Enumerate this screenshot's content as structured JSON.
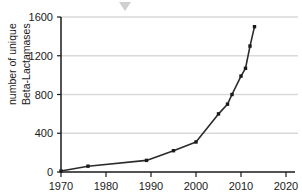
{
  "chart_data": {
    "type": "line",
    "title": "",
    "xlabel": "",
    "ylabel": "number of unique Beta-Lactamases",
    "ylabel_line1": "number of unique",
    "ylabel_line2": "Beta-Lactamases",
    "xlim": [
      1970,
      2020
    ],
    "ylim": [
      0,
      1600
    ],
    "xticks": [
      1970,
      1980,
      1990,
      2000,
      2010,
      2020
    ],
    "yticks": [
      0,
      400,
      800,
      1200,
      1600
    ],
    "xtick_labels": [
      "1970",
      "1980",
      "1990",
      "2000",
      "2010",
      "2020"
    ],
    "ytick_labels": [
      "0",
      "400",
      "800",
      "1200",
      "1600"
    ],
    "grid": "horizontal",
    "legend": "none",
    "series": [
      {
        "name": "unique Beta-Lactamases",
        "color": "#2b2b2b",
        "x": [
          1970,
          1976,
          1989,
          1995,
          2000,
          2005,
          2007,
          2008,
          2010,
          2011,
          2012,
          2013
        ],
        "values": [
          10,
          60,
          120,
          220,
          310,
          600,
          700,
          800,
          990,
          1070,
          1300,
          1500
        ]
      }
    ],
    "annotations": [
      {
        "name": "top-chevron-marker",
        "color": "#cfcfcf",
        "x_px": 125,
        "y_px": 2
      }
    ]
  },
  "colors": {
    "axis": "#1a1a1a",
    "grid": "#d9d9d9",
    "line": "#2b2b2b",
    "background": "#ffffff",
    "marker_gray": "#cfcfcf"
  }
}
